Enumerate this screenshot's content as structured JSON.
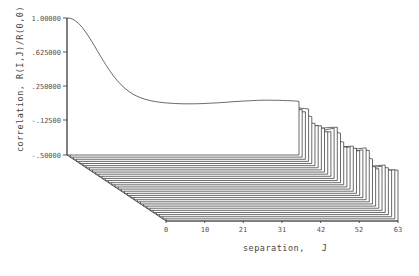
{
  "chart_data": {
    "type": "waterfall-3d-line",
    "title": "",
    "ylabel": "correlation, R(I,J)/R(0,0)",
    "xlabel": "separation,   J",
    "y_ticks": [
      "1.00000",
      ".625000",
      ".250000",
      "-.12500",
      "-.50000"
    ],
    "y_tick_values": [
      1.0,
      0.625,
      0.25,
      -0.125,
      -0.5
    ],
    "x_ticks": [
      "0",
      "10",
      "21",
      "31",
      "42",
      "52",
      "63"
    ],
    "x_tick_values": [
      0,
      10,
      21,
      31,
      42,
      52,
      63
    ],
    "ylim": [
      -0.5,
      1.0
    ],
    "xlim": [
      0,
      63
    ],
    "num_slices_I": 32,
    "grid": false,
    "series_hint": [
      {
        "name": "I=0",
        "values_at_J": {
          "0": 1.0,
          "10": 0.45,
          "21": 0.12,
          "31": 0.08,
          "42": 0.1,
          "52": 0.08
        }
      },
      {
        "name": "I=1",
        "values_at_J": {
          "0": 0.68,
          "10": 0.35,
          "21": 0.1,
          "31": 0.05,
          "42": 0.04,
          "52": 0.02
        }
      },
      {
        "name": "I=2",
        "values_at_J": {
          "0": 0.3,
          "10": 0.3,
          "21": 0.05,
          "31": 0.0,
          "42": 0.0,
          "52": 0.0
        }
      },
      {
        "name": "I>=3",
        "values_at_J": {
          "0": -0.05,
          "31": 0.0,
          "63": 0.0
        }
      }
    ]
  },
  "axes": {
    "y_title": "correlation, R(I,J)/R(0,0)",
    "x_title": "separation,   J",
    "y_ticks": [
      "1.00000",
      ".625000",
      ".250000",
      "-.12500",
      "-.50000"
    ],
    "x_ticks": [
      "0",
      "10",
      "21",
      "31",
      "42",
      "52",
      "63"
    ]
  }
}
